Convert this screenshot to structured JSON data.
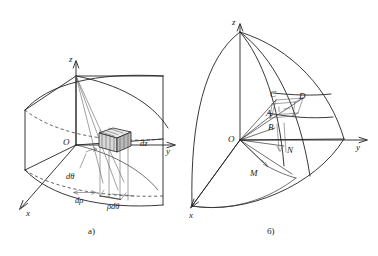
{
  "figure": {
    "background_color": "#ffffff",
    "line_color": "#222222",
    "element_fill_color": "#d8d8d8",
    "panels": [
      {
        "caption": "а)",
        "system": "cylindrical",
        "axes": {
          "x": "x",
          "y": "y",
          "z": "z"
        },
        "origin_label": "O",
        "element_labels": {
          "dz": "dz",
          "d_theta": "dθ",
          "d_rho": "dρ",
          "rho_d_theta": "ρdθ"
        }
      },
      {
        "caption": "б)",
        "system": "spherical",
        "axes": {
          "x": "x",
          "y": "y",
          "z": "z"
        },
        "origin_label": "O",
        "point_labels": {
          "A": "A",
          "B": "B",
          "C": "C",
          "D": "D",
          "M": "M",
          "N": "N"
        }
      }
    ]
  }
}
